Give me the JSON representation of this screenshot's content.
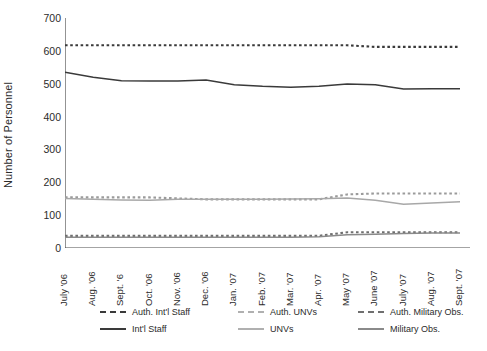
{
  "chart_data": {
    "type": "line",
    "title": "",
    "xlabel": "",
    "ylabel": "Number of Personnel",
    "ylim": [
      0,
      700
    ],
    "yticks": [
      0,
      100,
      200,
      300,
      400,
      500,
      600,
      700
    ],
    "grid": false,
    "legend_position": "bottom",
    "categories": [
      "July '06",
      "Aug. '06",
      "Sept. '6",
      "Oct. '06",
      "Nov. '06",
      "Dec. '06",
      "Jan. '07",
      "Feb. '07",
      "Mar. '07",
      "Apr. '07",
      "May '07",
      "June '07",
      "July '07",
      "Aug. '07",
      "Sept. '07"
    ],
    "series": [
      {
        "name": "Auth. Int'l Staff",
        "style": "dotted",
        "color": "#3a3a3a",
        "values": [
          617,
          617,
          617,
          617,
          617,
          617,
          617,
          617,
          617,
          617,
          617,
          612,
          612,
          612,
          612
        ]
      },
      {
        "name": "Int'l Staff",
        "style": "solid",
        "color": "#3a3a3a",
        "values": [
          535,
          520,
          509,
          508,
          508,
          511,
          497,
          492,
          489,
          492,
          499,
          497,
          484,
          485,
          485
        ]
      },
      {
        "name": "Auth. UNVs",
        "style": "dotted",
        "color": "#9b9b9b",
        "values": [
          154,
          154,
          154,
          154,
          151,
          148,
          148,
          148,
          148,
          148,
          163,
          166,
          166,
          166,
          166
        ]
      },
      {
        "name": "UNVs",
        "style": "solid",
        "color": "#a8a8a8",
        "values": [
          151,
          148,
          146,
          145,
          148,
          148,
          148,
          148,
          149,
          150,
          152,
          145,
          133,
          137,
          141
        ]
      },
      {
        "name": "Auth. Military Obs.",
        "style": "dotted",
        "color": "#6f6f6f",
        "values": [
          37,
          37,
          37,
          37,
          37,
          37,
          37,
          37,
          37,
          37,
          48,
          48,
          48,
          48,
          48
        ]
      },
      {
        "name": "Military Obs.",
        "style": "solid",
        "color": "#8a8a8a",
        "values": [
          33,
          33,
          33,
          33,
          33,
          33,
          33,
          33,
          33,
          34,
          40,
          42,
          44,
          46,
          46
        ]
      }
    ]
  },
  "legend": {
    "items": [
      {
        "label": "Auth. Int'l Staff",
        "style": "dotted",
        "color": "#3a3a3a"
      },
      {
        "label": "Auth. UNVs",
        "style": "dotted",
        "color": "#b0b0b0"
      },
      {
        "label": "Auth. Military Obs.",
        "style": "dotted",
        "color": "#6f6f6f"
      },
      {
        "label": "Int'l Staff",
        "style": "solid",
        "color": "#3a3a3a"
      },
      {
        "label": "UNVs",
        "style": "solid",
        "color": "#b0b0b0"
      },
      {
        "label": "Military Obs.",
        "style": "solid",
        "color": "#8a8a8a"
      }
    ]
  }
}
